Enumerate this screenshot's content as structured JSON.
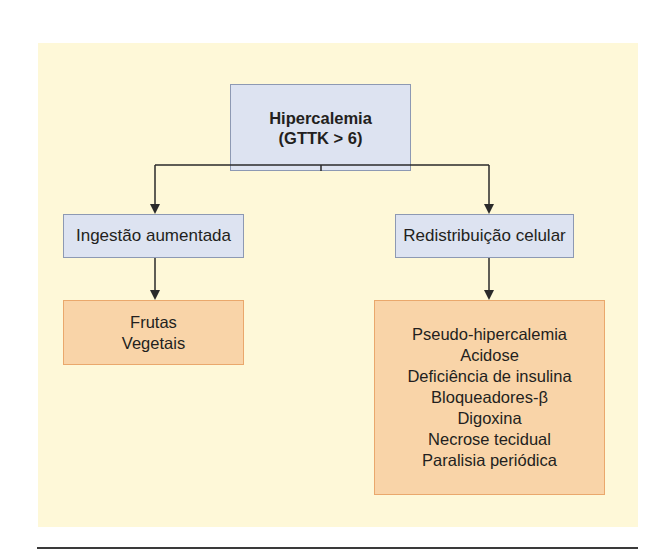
{
  "diagram": {
    "type": "flowchart",
    "colors": {
      "background_panel": "#fef8d8",
      "blue_box_fill": "#dde3f1",
      "blue_box_border": "#8d99b3",
      "orange_box_fill": "#f9d4a8",
      "orange_box_border": "#eaa86c",
      "connector": "#2a2a2a"
    },
    "root": {
      "line1": "Hipercalemia",
      "line2": "(GTTK > 6)"
    },
    "branches": [
      {
        "label": "Ingestão aumentada",
        "causes": [
          "Frutas",
          "Vegetais"
        ]
      },
      {
        "label": "Redistribuição celular",
        "causes": [
          "Pseudo-hipercalemia",
          "Acidose",
          "Deficiência de insulina",
          "Bloqueadores-β",
          "Digoxina",
          "Necrose tecidual",
          "Paralisia periódica"
        ]
      }
    ]
  }
}
